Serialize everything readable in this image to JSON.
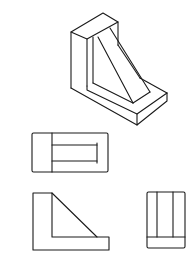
{
  "figure": {
    "stroke_color": "#1a1a1a",
    "background": "#ffffff",
    "views": [
      {
        "id": "isometric",
        "label": ""
      },
      {
        "id": "top",
        "label": ""
      },
      {
        "id": "front",
        "label": ""
      },
      {
        "id": "side",
        "label": ""
      }
    ]
  }
}
